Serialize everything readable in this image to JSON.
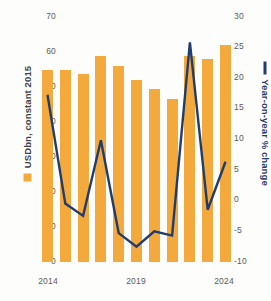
{
  "chart_data": {
    "type": "bar",
    "title": "",
    "subtitle": "",
    "categories": [
      "2014",
      "2015",
      "2016",
      "2017",
      "2018",
      "2019",
      "2020",
      "2021",
      "2022",
      "2023",
      "2024"
    ],
    "x_tick_labels": [
      "2014",
      "2019",
      "2024"
    ],
    "xlabel": "",
    "grid": false,
    "legend_position": "axis-titles",
    "series": [
      {
        "name": "USDbn, constant 2015",
        "type": "bar",
        "axis": "left",
        "color": "#f4a93c",
        "values": [
          54.7,
          54.7,
          53.5,
          58.5,
          55.8,
          51.8,
          49.2,
          46.5,
          58.5,
          57.8,
          61.8
        ]
      },
      {
        "name": "Year-on-year % change",
        "type": "line",
        "axis": "right",
        "color": "#1f3d6e",
        "values": [
          17.2,
          -0.5,
          -2.5,
          9.8,
          -5.3,
          -7.5,
          -5.0,
          -5.7,
          25.7,
          -1.5,
          6.3
        ]
      }
    ],
    "left_axis": {
      "label": "USDbn, constant 2015",
      "ticks": [
        0,
        10,
        20,
        30,
        40,
        50,
        60,
        70
      ],
      "ylim": [
        0,
        70
      ]
    },
    "right_axis": {
      "label": "Year-on-year % change",
      "ticks": [
        -10,
        -5,
        0,
        5,
        10,
        15,
        20,
        25,
        30
      ],
      "ylim": [
        -10,
        30
      ]
    },
    "colors": {
      "bar": "#f4a93c",
      "line": "#1f3d6e",
      "tick_text": "#5b5b5b",
      "background": "#fdfdfc"
    }
  }
}
